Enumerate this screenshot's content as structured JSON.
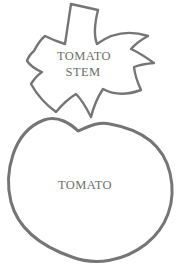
{
  "diagram": {
    "stem": {
      "label_line1": "TOMATO",
      "label_line2": "STEM"
    },
    "body": {
      "label": "TOMATO"
    }
  },
  "shapes": {
    "stem_outline": "leafy-star-with-stalk",
    "body_outline": "rounded-tomato-blob"
  },
  "colors": {
    "outline": "#757575",
    "label_text": "#6e6e6e",
    "background": "#ffffff"
  }
}
